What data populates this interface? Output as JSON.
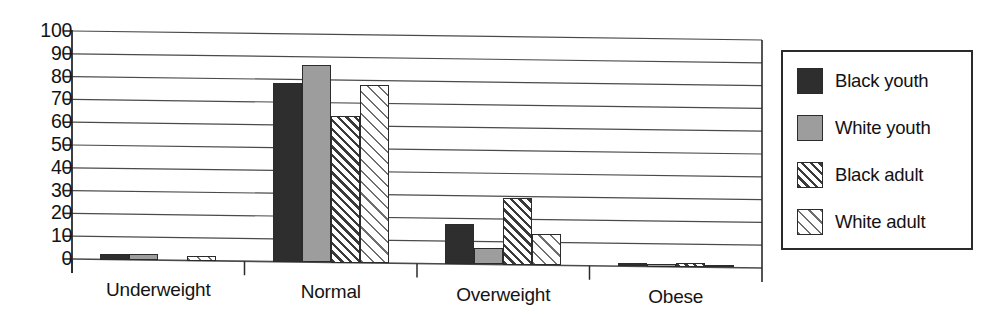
{
  "chart_data": {
    "type": "bar",
    "title": "",
    "subtitle": "",
    "xlabel": "",
    "ylabel": "",
    "categories": [
      "Underweight",
      "Normal",
      "Overweight",
      "Obese"
    ],
    "ylim": [
      0,
      100
    ],
    "yticks": [
      0,
      10,
      20,
      30,
      40,
      50,
      60,
      70,
      80,
      90,
      100
    ],
    "ytick_labels": [
      "0",
      "10",
      "20",
      "30",
      "40",
      "50",
      "60",
      "70",
      "80",
      "90",
      "100"
    ],
    "grid": true,
    "grid_axis": "y",
    "legend_position": "right",
    "series": [
      {
        "name": "Black youth",
        "fill": "solid-dark",
        "color": "#2e2e2e",
        "values": [
          2.5,
          78.5,
          17.5,
          1.5
        ]
      },
      {
        "name": "White youth",
        "fill": "solid-gray",
        "color": "#9d9d9d",
        "values": [
          2.5,
          86.5,
          7.0,
          1.0
        ]
      },
      {
        "name": "Black adult",
        "fill": "hatch-dense",
        "color": "#3a3a3a",
        "values": [
          0.0,
          64.5,
          29.5,
          1.8
        ]
      },
      {
        "name": "White adult",
        "fill": "hatch-light",
        "color": "#6e6e6e",
        "values": [
          2.0,
          78.0,
          13.5,
          1.0
        ]
      }
    ]
  },
  "legend": {
    "items": [
      {
        "label": "Black youth",
        "swatch": "solid-dark-swatch"
      },
      {
        "label": "White youth",
        "swatch": "solid-gray-swatch"
      },
      {
        "label": "Black adult",
        "swatch": "hatch-dense-swatch"
      },
      {
        "label": "White adult",
        "swatch": "hatch-light-swatch"
      }
    ]
  },
  "axes": {
    "y_labels": [
      "100",
      "90",
      "80",
      "70",
      "60",
      "50",
      "40",
      "30",
      "20",
      "10",
      "0"
    ],
    "x_labels": [
      "Underweight",
      "Normal",
      "Overweight",
      "Obese"
    ]
  },
  "colors": {
    "axis": "#2a2a2a",
    "grid": "#4a4a4a",
    "background": "#ffffff",
    "text": "#141414"
  }
}
